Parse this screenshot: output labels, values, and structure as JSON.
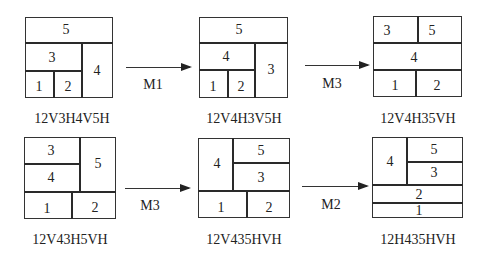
{
  "figure": {
    "panels": [
      {
        "id": "p1",
        "caption": "12V3H4V5H",
        "box": {
          "x": 25,
          "y": 17,
          "w": 88,
          "h": 81
        },
        "caption_pos": {
          "x": 72,
          "y": 119
        },
        "hlines": [
          {
            "x1": 25,
            "x2": 113,
            "y": 43
          },
          {
            "x1": 25,
            "x2": 82,
            "y": 71
          }
        ],
        "vlines": [
          {
            "x": 82,
            "y1": 43,
            "y2": 98
          },
          {
            "x": 54,
            "y1": 71,
            "y2": 98
          }
        ],
        "labels": [
          {
            "text": "5",
            "x": 66,
            "y": 30
          },
          {
            "text": "3",
            "x": 52,
            "y": 58
          },
          {
            "text": "4",
            "x": 97,
            "y": 71
          },
          {
            "text": "1",
            "x": 39,
            "y": 87
          },
          {
            "text": "2",
            "x": 68,
            "y": 87
          }
        ]
      },
      {
        "id": "p2",
        "caption": "12V4H3V5H",
        "box": {
          "x": 199,
          "y": 17,
          "w": 89,
          "h": 81
        },
        "caption_pos": {
          "x": 244,
          "y": 119
        },
        "hlines": [
          {
            "x1": 199,
            "x2": 288,
            "y": 43
          },
          {
            "x1": 199,
            "x2": 255,
            "y": 70
          }
        ],
        "vlines": [
          {
            "x": 255,
            "y1": 43,
            "y2": 98
          },
          {
            "x": 228,
            "y1": 70,
            "y2": 98
          }
        ],
        "labels": [
          {
            "text": "5",
            "x": 239,
            "y": 30
          },
          {
            "text": "4",
            "x": 226,
            "y": 57
          },
          {
            "text": "3",
            "x": 271,
            "y": 70
          },
          {
            "text": "1",
            "x": 213,
            "y": 87
          },
          {
            "text": "2",
            "x": 241,
            "y": 87
          }
        ]
      },
      {
        "id": "p3",
        "caption": "12V4H35VH",
        "box": {
          "x": 373,
          "y": 16,
          "w": 89,
          "h": 81
        },
        "caption_pos": {
          "x": 418,
          "y": 119
        },
        "hlines": [
          {
            "x1": 373,
            "x2": 462,
            "y": 43
          },
          {
            "x1": 373,
            "x2": 462,
            "y": 70
          }
        ],
        "vlines": [
          {
            "x": 418,
            "y1": 16,
            "y2": 43
          },
          {
            "x": 416,
            "y1": 70,
            "y2": 97
          }
        ],
        "labels": [
          {
            "text": "3",
            "x": 387,
            "y": 31
          },
          {
            "text": "5",
            "x": 432,
            "y": 31
          },
          {
            "text": "4",
            "x": 414,
            "y": 58
          },
          {
            "text": "1",
            "x": 395,
            "y": 86
          },
          {
            "text": "2",
            "x": 437,
            "y": 86
          }
        ]
      },
      {
        "id": "p4",
        "caption": "12V43H5VH",
        "box": {
          "x": 24,
          "y": 137,
          "w": 92,
          "h": 82
        },
        "caption_pos": {
          "x": 70,
          "y": 240
        },
        "hlines": [
          {
            "x1": 24,
            "x2": 80,
            "y": 164
          },
          {
            "x1": 24,
            "x2": 116,
            "y": 192
          }
        ],
        "vlines": [
          {
            "x": 80,
            "y1": 137,
            "y2": 192
          },
          {
            "x": 72,
            "y1": 192,
            "y2": 219
          }
        ],
        "labels": [
          {
            "text": "3",
            "x": 51,
            "y": 151
          },
          {
            "text": "4",
            "x": 51,
            "y": 178
          },
          {
            "text": "5",
            "x": 98,
            "y": 164
          },
          {
            "text": "1",
            "x": 47,
            "y": 209
          },
          {
            "text": "2",
            "x": 95,
            "y": 208
          }
        ]
      },
      {
        "id": "p5",
        "caption": "12V435HVH",
        "box": {
          "x": 198,
          "y": 138,
          "w": 92,
          "h": 80
        },
        "caption_pos": {
          "x": 244,
          "y": 240
        },
        "hlines": [
          {
            "x1": 233,
            "x2": 290,
            "y": 163
          },
          {
            "x1": 198,
            "x2": 290,
            "y": 191
          }
        ],
        "vlines": [
          {
            "x": 233,
            "y1": 138,
            "y2": 191
          },
          {
            "x": 247,
            "y1": 191,
            "y2": 218
          }
        ],
        "labels": [
          {
            "text": "4",
            "x": 217,
            "y": 164
          },
          {
            "text": "5",
            "x": 261,
            "y": 151
          },
          {
            "text": "3",
            "x": 261,
            "y": 178
          },
          {
            "text": "1",
            "x": 221,
            "y": 208
          },
          {
            "text": "2",
            "x": 269,
            "y": 208
          }
        ]
      },
      {
        "id": "p6",
        "caption": "12H435HVH",
        "box": {
          "x": 372,
          "y": 137,
          "w": 91,
          "h": 81
        },
        "caption_pos": {
          "x": 418,
          "y": 240
        },
        "hlines": [
          {
            "x1": 407,
            "x2": 463,
            "y": 162
          },
          {
            "x1": 372,
            "x2": 463,
            "y": 185
          },
          {
            "x1": 372,
            "x2": 463,
            "y": 203
          }
        ],
        "vlines": [
          {
            "x": 407,
            "y1": 137,
            "y2": 185
          }
        ],
        "labels": [
          {
            "text": "4",
            "x": 390,
            "y": 162
          },
          {
            "text": "5",
            "x": 434,
            "y": 150
          },
          {
            "text": "3",
            "x": 434,
            "y": 173
          },
          {
            "text": "2",
            "x": 419,
            "y": 195
          },
          {
            "text": "1",
            "x": 419,
            "y": 211
          }
        ]
      }
    ],
    "arrows": [
      {
        "id": "a1",
        "label": "M1",
        "x1": 126,
        "x2": 190,
        "y": 67,
        "label_pos": {
          "x": 153,
          "y": 85
        }
      },
      {
        "id": "a2",
        "label": "M3",
        "x1": 305,
        "x2": 368,
        "y": 65,
        "label_pos": {
          "x": 332,
          "y": 84
        }
      },
      {
        "id": "a3",
        "label": "M3",
        "x1": 125,
        "x2": 189,
        "y": 188,
        "label_pos": {
          "x": 150,
          "y": 206
        }
      },
      {
        "id": "a4",
        "label": "M2",
        "x1": 302,
        "x2": 367,
        "y": 186,
        "label_pos": {
          "x": 331,
          "y": 205
        }
      }
    ]
  }
}
